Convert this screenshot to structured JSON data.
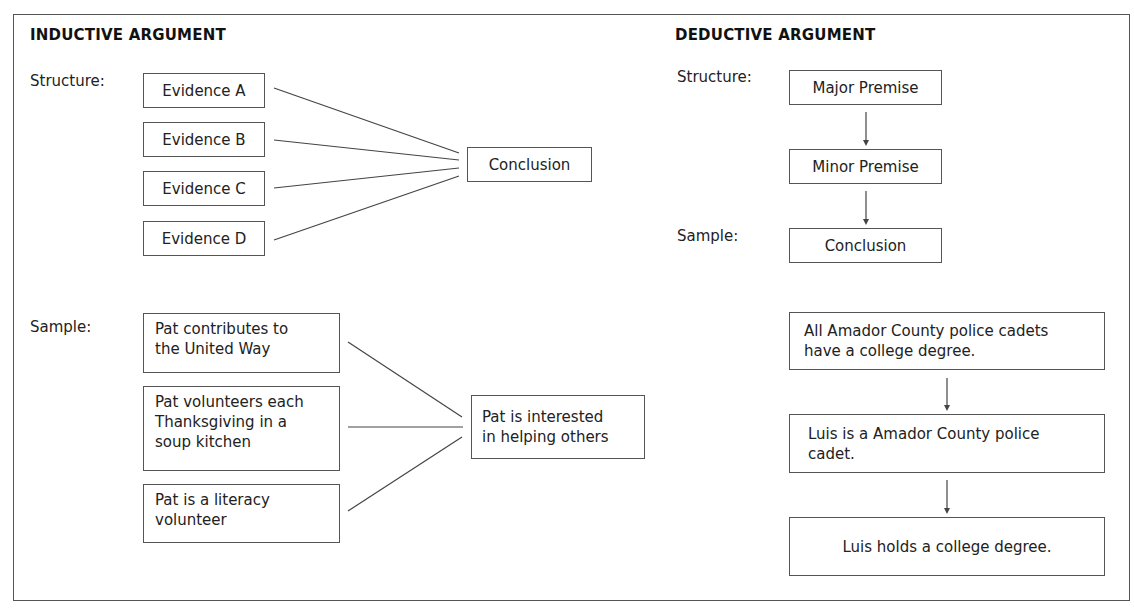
{
  "inductive": {
    "heading": "INDUCTIVE ARGUMENT",
    "structure_label": "Structure:",
    "sample_label": "Sample:",
    "structure": {
      "evidence": [
        "Evidence A",
        "Evidence B",
        "Evidence C",
        "Evidence D"
      ],
      "conclusion": "Conclusion"
    },
    "sample": {
      "evidence": [
        "Pat contributes to\nthe United Way",
        "Pat volunteers each\nThanksgiving in a\nsoup kitchen",
        "Pat is a literacy\nvolunteer"
      ],
      "conclusion": "Pat is interested\nin helping others"
    }
  },
  "deductive": {
    "heading": "DEDUCTIVE ARGUMENT",
    "structure_label": "Structure:",
    "sample_label": "Sample:",
    "structure": {
      "major_premise": "Major Premise",
      "minor_premise": "Minor Premise",
      "conclusion": "Conclusion"
    },
    "sample": {
      "major_premise": "All Amador County police cadets\nhave a college degree.",
      "minor_premise": "Luis is a Amador County police\ncadet.",
      "conclusion": "Luis holds a college degree."
    }
  }
}
